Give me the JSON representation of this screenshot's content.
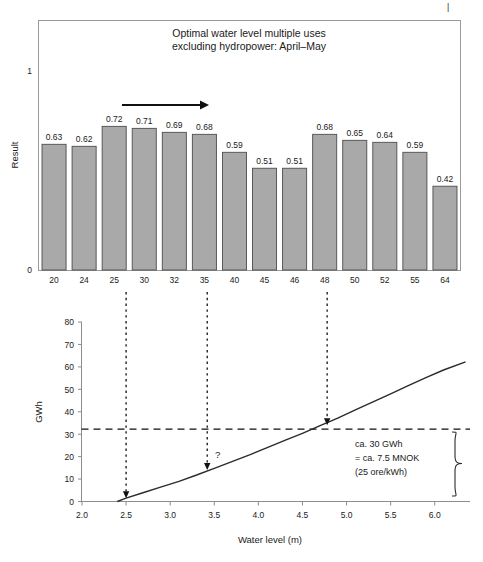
{
  "figure": {
    "background": "#ffffff",
    "top_mark": "|"
  },
  "chart_data": [
    {
      "type": "bar",
      "title": "Optimal water level multiple uses\nexcluding hydropower: April–May",
      "title_line1": "Optimal water level multiple uses",
      "title_line2": "excluding hydropower: April–May",
      "xlabel": "",
      "ylabel": "Result",
      "categories": [
        "20",
        "24",
        "25",
        "30",
        "32",
        "35",
        "40",
        "45",
        "46",
        "48",
        "50",
        "52",
        "55",
        "64"
      ],
      "values": [
        0.63,
        0.62,
        0.72,
        0.71,
        0.69,
        0.68,
        0.59,
        0.51,
        0.51,
        0.68,
        0.65,
        0.64,
        0.59,
        0.42
      ],
      "value_labels": [
        "0.63",
        "0.62",
        "0.72",
        "0.71",
        "0.69",
        "0.68",
        "0.59",
        "0.51",
        "0.51",
        "0.68",
        "0.65",
        "0.64",
        "0.59",
        "0.42"
      ],
      "ylim": [
        0,
        1.18
      ],
      "ytick_values": [
        0,
        1
      ],
      "ytick_labels": [
        "0",
        "1"
      ],
      "grid": false,
      "legend": "none",
      "bar_fill": "#a9a9a9",
      "bar_stroke": "#4d4d4d",
      "frame": true,
      "annotations": [
        {
          "name": "range-arrow",
          "type": "arrow",
          "from_category": "25",
          "to_category": "35",
          "label": ""
        }
      ]
    },
    {
      "type": "line",
      "title": "",
      "xlabel": "Water level (m)",
      "ylabel": "GWh",
      "xlim": [
        2.0,
        6.4
      ],
      "ylim": [
        0,
        80
      ],
      "xtick_values": [
        2.0,
        2.5,
        3.0,
        3.5,
        4.0,
        4.5,
        5.0,
        5.5,
        6.0
      ],
      "xtick_labels": [
        "2.0",
        "2.5",
        "3.0",
        "3.5",
        "4.0",
        "4.5",
        "5.0",
        "5.5",
        "6.0"
      ],
      "ytick_values": [
        0,
        10,
        20,
        30,
        40,
        50,
        60,
        70,
        80
      ],
      "ytick_labels": [
        "0",
        "10",
        "20",
        "30",
        "40",
        "50",
        "60",
        "70",
        "80"
      ],
      "grid": false,
      "legend": "none",
      "series": [
        {
          "name": "GWh vs water level",
          "x": [
            2.4,
            2.5,
            2.7,
            2.9,
            3.1,
            3.3,
            3.5,
            3.7,
            3.9,
            4.1,
            4.3,
            4.5,
            4.7,
            4.9,
            5.1,
            5.3,
            5.5,
            5.7,
            5.9,
            6.1,
            6.35
          ],
          "y": [
            0.0,
            1.5,
            4.0,
            6.5,
            9.0,
            11.8,
            14.8,
            17.8,
            20.8,
            24.0,
            27.2,
            30.4,
            33.8,
            37.2,
            40.8,
            44.4,
            48.0,
            51.6,
            55.2,
            58.6,
            62.2
          ]
        }
      ],
      "reference_lines": [
        {
          "name": "gwh-threshold",
          "orientation": "horizontal",
          "value": 32,
          "style": "dashed"
        }
      ],
      "drop_arrows": [
        {
          "name": "drop-arrow-25",
          "x": 2.5,
          "y_end": 1.5,
          "label": ""
        },
        {
          "name": "drop-arrow-mid",
          "x": 3.42,
          "y_end": 14.0,
          "label": "?"
        },
        {
          "name": "drop-arrow-48",
          "x": 4.78,
          "y_end": 34.0,
          "label": ""
        }
      ],
      "annotation_box": {
        "line1": "ca. 30 GWh",
        "line2": "= ca. 7.5 MNOK",
        "line3": "(25 ore/kWh)",
        "brace": true
      }
    }
  ]
}
